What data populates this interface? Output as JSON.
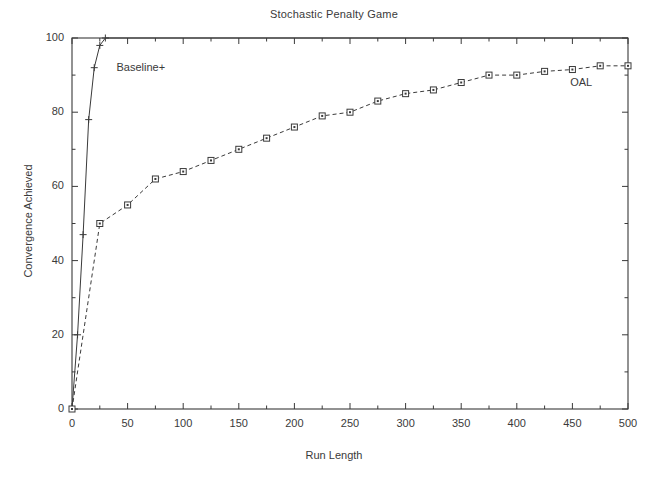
{
  "chart_data": {
    "type": "line",
    "title": "Stochastic Penalty Game",
    "xlabel": "Run Length",
    "ylabel": "Convergence Achieved",
    "xlim": [
      0,
      500
    ],
    "ylim": [
      0,
      100
    ],
    "xticks": [
      0,
      50,
      100,
      150,
      200,
      250,
      300,
      350,
      400,
      450,
      500
    ],
    "yticks": [
      0,
      20,
      40,
      60,
      80,
      100
    ],
    "xtick_labels": [
      "0",
      "50",
      "100",
      "150",
      "200",
      "250",
      "300",
      "350",
      "400",
      "450",
      "500"
    ],
    "ytick_labels": [
      "0",
      "20",
      "40",
      "60",
      "80",
      "100"
    ],
    "grid": false,
    "legend": "annotations-on-curve",
    "frame": "box",
    "series": [
      {
        "name": "Baseline+",
        "marker": "plus",
        "linestyle": "solid",
        "color": "#3a3a3a",
        "annotation": "Baseline+",
        "annotation_x": 40,
        "annotation_y": 92,
        "x": [
          0,
          5,
          10,
          15,
          20,
          25,
          30,
          500
        ],
        "y": [
          0,
          20,
          47,
          78,
          92,
          98,
          100,
          100
        ]
      },
      {
        "name": "OAL",
        "marker": "square",
        "linestyle": "dashed",
        "color": "#3a3a3a",
        "annotation": "OAL",
        "annotation_x": 448,
        "annotation_y": 88,
        "x": [
          0,
          25,
          50,
          75,
          100,
          125,
          150,
          175,
          200,
          225,
          250,
          275,
          300,
          325,
          350,
          375,
          400,
          425,
          450,
          475,
          500
        ],
        "y": [
          0,
          50,
          55,
          62,
          64,
          67,
          70,
          73,
          76,
          79,
          80,
          83,
          85,
          86,
          88,
          90,
          90,
          91,
          91.5,
          92.5,
          92.5
        ]
      }
    ]
  }
}
